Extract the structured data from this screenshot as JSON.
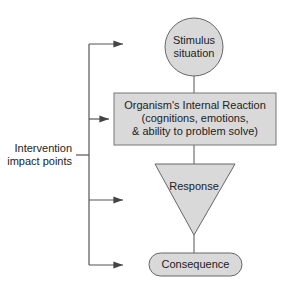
{
  "diagram": {
    "type": "flowchart",
    "nodes": [
      {
        "id": "stimulus",
        "shape": "circle",
        "lines": [
          "Stimulus",
          "situation"
        ]
      },
      {
        "id": "internal",
        "shape": "rectangle",
        "lines": [
          "Organism's Internal Reaction",
          "(cognitions, emotions,",
          "& ability to problem solve)"
        ]
      },
      {
        "id": "response",
        "shape": "inverted-triangle",
        "lines": [
          "Response"
        ]
      },
      {
        "id": "consequence",
        "shape": "rounded-pill",
        "lines": [
          "Consequence"
        ]
      }
    ],
    "edges": [
      {
        "from": "stimulus",
        "to": "internal"
      },
      {
        "from": "internal",
        "to": "response"
      },
      {
        "from": "response",
        "to": "consequence"
      }
    ],
    "side_label": {
      "lines": [
        "Intervention",
        "impact points"
      ]
    },
    "intervention_arrows": [
      "stimulus",
      "internal",
      "response",
      "consequence"
    ],
    "colors": {
      "fill": "#d9d9d9",
      "stroke": "#555555",
      "text": "#222222"
    }
  }
}
